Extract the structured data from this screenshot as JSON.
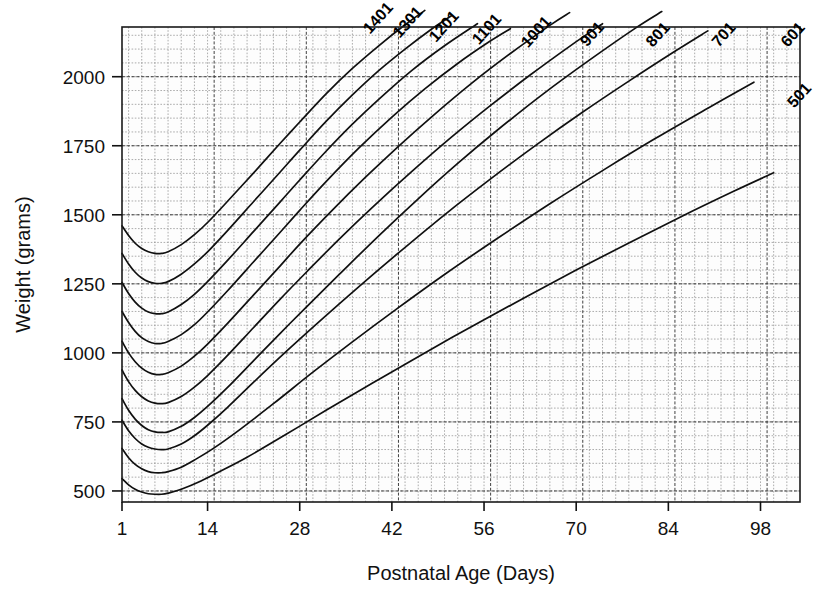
{
  "chart_data": {
    "type": "line",
    "title": "",
    "xlabel": "Postnatal Age (Days)",
    "ylabel": "Weight (grams)",
    "xlim": [
      1,
      104
    ],
    "ylim": [
      460,
      2180
    ],
    "xticks": [
      1,
      14,
      28,
      42,
      56,
      70,
      84,
      98
    ],
    "xtick_labels": [
      "1",
      "14",
      "28",
      "42",
      "56",
      "70",
      "84",
      "98"
    ],
    "yticks": [
      500,
      750,
      1000,
      1250,
      1500,
      1750,
      2000
    ],
    "ytick_labels": [
      "500",
      "750",
      "1000",
      "1250",
      "1500",
      "1750",
      "2000"
    ],
    "grid": "on",
    "grid_minor_x_step": 2,
    "grid_minor_y_step": 50,
    "grid_major_x_step": 14,
    "grid_major_y_step": 250,
    "legend": "inline-curve-labels",
    "series": [
      {
        "name": "1401",
        "label": "1401",
        "x": [
          1,
          2,
          3,
          4,
          5,
          6,
          7,
          8,
          10,
          12,
          14,
          17,
          21,
          25,
          28,
          32,
          36,
          40,
          44,
          47
        ],
        "y": [
          1460,
          1425,
          1397,
          1378,
          1366,
          1360,
          1360,
          1366,
          1392,
          1428,
          1472,
          1548,
          1652,
          1758,
          1836,
          1938,
          2030,
          2112,
          2188,
          2240
        ]
      },
      {
        "name": "1301",
        "label": "1301",
        "x": [
          1,
          2,
          3,
          4,
          5,
          6,
          7,
          8,
          10,
          12,
          14,
          17,
          21,
          25,
          28,
          32,
          36,
          40,
          44,
          48,
          51
        ],
        "y": [
          1360,
          1322,
          1292,
          1271,
          1258,
          1252,
          1252,
          1258,
          1285,
          1322,
          1366,
          1442,
          1548,
          1654,
          1734,
          1838,
          1934,
          2022,
          2100,
          2172,
          2220
        ]
      },
      {
        "name": "1201",
        "label": "1201",
        "x": [
          1,
          2,
          3,
          4,
          5,
          6,
          7,
          8,
          10,
          12,
          14,
          17,
          21,
          25,
          28,
          32,
          36,
          40,
          45,
          50,
          55
        ],
        "y": [
          1255,
          1215,
          1184,
          1162,
          1148,
          1142,
          1142,
          1148,
          1175,
          1212,
          1258,
          1334,
          1440,
          1546,
          1626,
          1730,
          1828,
          1918,
          2022,
          2112,
          2192
        ]
      },
      {
        "name": "1101",
        "label": "1101",
        "x": [
          1,
          2,
          3,
          4,
          5,
          6,
          7,
          8,
          10,
          12,
          14,
          17,
          21,
          25,
          28,
          32,
          37,
          42,
          47,
          52,
          57,
          60
        ],
        "y": [
          1150,
          1110,
          1078,
          1055,
          1041,
          1034,
          1034,
          1041,
          1066,
          1102,
          1148,
          1224,
          1330,
          1436,
          1516,
          1620,
          1742,
          1854,
          1956,
          2048,
          2130,
          2174
        ]
      },
      {
        "name": "1001",
        "label": "1001",
        "x": [
          1,
          2,
          3,
          4,
          5,
          6,
          7,
          8,
          10,
          12,
          14,
          17,
          21,
          25,
          28,
          33,
          38,
          43,
          48,
          54,
          60,
          66,
          69
        ],
        "y": [
          1042,
          1000,
          968,
          945,
          930,
          922,
          922,
          928,
          952,
          988,
          1032,
          1106,
          1210,
          1314,
          1394,
          1518,
          1636,
          1748,
          1854,
          1974,
          2084,
          2186,
          2232
        ]
      },
      {
        "name": "901",
        "label": "901",
        "x": [
          1,
          2,
          3,
          4,
          5,
          6,
          7,
          8,
          10,
          12,
          14,
          17,
          21,
          25,
          29,
          34,
          39,
          45,
          51,
          57,
          63,
          69,
          74
        ],
        "y": [
          938,
          896,
          864,
          841,
          826,
          818,
          816,
          820,
          842,
          876,
          918,
          990,
          1092,
          1194,
          1292,
          1412,
          1526,
          1656,
          1780,
          1896,
          2006,
          2110,
          2192
        ]
      },
      {
        "name": "801",
        "label": "801",
        "x": [
          1,
          2,
          3,
          4,
          5,
          6,
          7,
          8,
          10,
          12,
          14,
          17,
          21,
          25,
          29,
          34,
          40,
          46,
          52,
          58,
          65,
          72,
          79,
          83
        ],
        "y": [
          834,
          792,
          760,
          737,
          722,
          714,
          712,
          714,
          734,
          766,
          806,
          874,
          972,
          1070,
          1166,
          1284,
          1424,
          1558,
          1686,
          1806,
          1938,
          2060,
          2176,
          2236
        ]
      },
      {
        "name": "701",
        "label": "701",
        "x": [
          1,
          2,
          3,
          4,
          5,
          6,
          7,
          8,
          10,
          12,
          14,
          17,
          21,
          26,
          31,
          37,
          43,
          50,
          57,
          64,
          71,
          78,
          85,
          90
        ],
        "y": [
          756,
          718,
          690,
          670,
          658,
          652,
          650,
          652,
          670,
          700,
          738,
          802,
          894,
          1006,
          1114,
          1240,
          1362,
          1500,
          1630,
          1754,
          1872,
          1984,
          2092,
          2166
        ]
      },
      {
        "name": "601",
        "label": "601",
        "x": [
          1,
          2,
          3,
          4,
          5,
          6,
          7,
          8,
          10,
          12,
          15,
          19,
          24,
          30,
          36,
          43,
          50,
          58,
          66,
          74,
          82,
          90,
          97
        ],
        "y": [
          654,
          620,
          596,
          580,
          570,
          566,
          566,
          570,
          586,
          612,
          656,
          724,
          816,
          930,
          1040,
          1164,
          1284,
          1414,
          1540,
          1660,
          1776,
          1886,
          1980
        ]
      },
      {
        "name": "501",
        "label": "501",
        "x": [
          1,
          2,
          3,
          4,
          5,
          6,
          7,
          8,
          10,
          13,
          16,
          20,
          26,
          32,
          39,
          46,
          54,
          62,
          70,
          78,
          86,
          94,
          100
        ],
        "y": [
          545,
          522,
          506,
          496,
          490,
          488,
          488,
          492,
          506,
          536,
          572,
          622,
          706,
          792,
          890,
          986,
          1094,
          1198,
          1300,
          1398,
          1494,
          1586,
          1652
        ]
      }
    ],
    "label_positions": [
      {
        "name": "1401",
        "x": 40.5,
        "y": 2200
      },
      {
        "name": "1301",
        "x": 45.0,
        "y": 2185
      },
      {
        "name": "1201",
        "x": 50.5,
        "y": 2170
      },
      {
        "name": "1101",
        "x": 57.0,
        "y": 2160
      },
      {
        "name": "1001",
        "x": 64.5,
        "y": 2150
      },
      {
        "name": "901",
        "x": 73.0,
        "y": 2142
      },
      {
        "name": "801",
        "x": 83.0,
        "y": 2140
      },
      {
        "name": "701",
        "x": 93.0,
        "y": 2140
      },
      {
        "name": "601",
        "x": 103.5,
        "y": 2140
      },
      {
        "name": "501",
        "x": 104.5,
        "y": 1920
      }
    ]
  },
  "colors": {
    "curve": "#101010",
    "grid_minor": "#8a8a8a",
    "grid_major": "#2b2b2b",
    "frame": "#1a1a1a",
    "text": "#111111",
    "background": "#ffffff",
    "plot_background": "#fdfdfd"
  },
  "figure": {
    "name": "postnatal-growth-curves",
    "width": 821,
    "height": 596
  }
}
